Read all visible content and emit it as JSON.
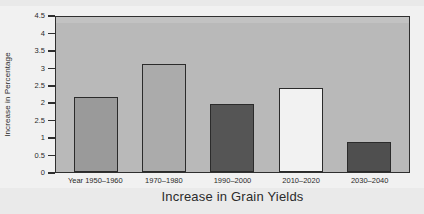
{
  "chart_data": {
    "type": "bar",
    "title": "",
    "xlabel": "Increase in Grain Yields",
    "ylabel": "Increase in Percentage",
    "categories": [
      "Year 1950–1960",
      "1970–1980",
      "1990–2000",
      "2010–2020",
      "2030–2040"
    ],
    "values": [
      2.15,
      3.1,
      1.95,
      2.4,
      0.85
    ],
    "bar_colors": [
      "#9a9a9a",
      "#ababab",
      "#555555",
      "#f2f2f2",
      "#4f4f4f"
    ],
    "ylim": [
      0,
      4.5
    ],
    "ytick_labels": [
      "4.5",
      "4",
      "3.5",
      "3",
      "2.5",
      "2",
      "2.5",
      "1",
      "0.5",
      "0"
    ],
    "ytick_positions": [
      4.5,
      4,
      3.5,
      3,
      2.5,
      2,
      1.5,
      1,
      0.5,
      0
    ],
    "grid": false,
    "legend": "none",
    "plot_background": "#b9b9b9",
    "axis_color": "#2f2f2f"
  }
}
